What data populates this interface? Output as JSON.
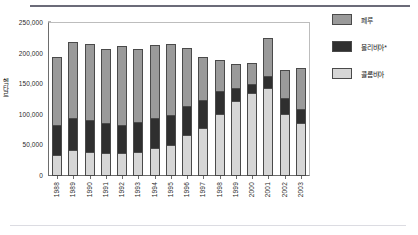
{
  "chart_data": {
    "type": "bar",
    "stacked": true,
    "title": "",
    "xlabel": "",
    "ylabel": "헥타르",
    "ylim": [
      0,
      250000
    ],
    "ytick_step": 50000,
    "grid": false,
    "legend_position": "right",
    "categories": [
      "1988",
      "1989",
      "1990",
      "1991",
      "1992",
      "1993",
      "1994",
      "1995",
      "1996",
      "1997",
      "1998",
      "1999",
      "2000",
      "2001",
      "2002",
      "2003"
    ],
    "series": [
      {
        "name": "콜롬비아",
        "color": "#d6d6d6",
        "values": [
          34000,
          42000,
          40000,
          38000,
          37000,
          40000,
          45000,
          51000,
          67000,
          79000,
          101000,
          122000,
          136000,
          144000,
          102000,
          86000
        ]
      },
      {
        "name": "볼리비아*",
        "color": "#2f2f2f",
        "values": [
          49000,
          53000,
          51000,
          48000,
          46000,
          48000,
          50000,
          49000,
          48000,
          46000,
          38000,
          22000,
          15000,
          20000,
          25000,
          24000
        ]
      },
      {
        "name": "페루",
        "color": "#9a9a9a",
        "values": [
          111000,
          124000,
          124000,
          121000,
          130000,
          120000,
          119000,
          115000,
          95000,
          69000,
          51000,
          39000,
          34000,
          62000,
          47000,
          67000
        ]
      }
    ],
    "totals": [
      194000,
      219000,
      215000,
      207000,
      213000,
      208000,
      214000,
      215000,
      210000,
      194000,
      190000,
      183000,
      185000,
      226000,
      174000,
      177000
    ],
    "ytick_labels": [
      "0",
      "50,000",
      "100,000",
      "150,000",
      "200,000",
      "250,000"
    ],
    "ytick_values": [
      0,
      50000,
      100000,
      150000,
      200000,
      250000
    ]
  },
  "legend": {
    "items": [
      {
        "label": "페루",
        "color": "#9a9a9a"
      },
      {
        "label": "볼리비아*",
        "color": "#2f2f2f"
      },
      {
        "label": "콜롬비아",
        "color": "#d6d6d6"
      }
    ]
  }
}
